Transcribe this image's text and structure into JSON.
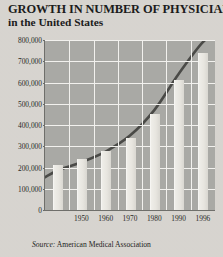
{
  "title": {
    "line1": "GROWTH IN NUMBER OF PHYSICIANS",
    "line2": "in the United States"
  },
  "source": {
    "label": "Source:",
    "text": " American Medical Association"
  },
  "colors": {
    "page_background": "#d8d5d0",
    "plot_background": "#a9a9a5",
    "gridline": "#f2f1ee",
    "bar_fill": "#e8e6e1",
    "curve": "#4a4a47",
    "text": "#1c1c1c"
  },
  "chart_data": {
    "type": "bar",
    "title": "GROWTH IN NUMBER OF PHYSICIANS in the United States",
    "subtitle": "in the United States",
    "xlabel": "",
    "ylabel": "",
    "ylim": [
      0,
      800000
    ],
    "ytick_values": [
      0,
      100000,
      200000,
      300000,
      400000,
      500000,
      600000,
      700000,
      800000
    ],
    "ytick_labels": [
      "0",
      "100,000",
      "200,000",
      "300,000",
      "400,000",
      "500,000",
      "600,000",
      "700,000",
      "800,000"
    ],
    "xtick_labels": [
      "1950",
      "1960",
      "1970",
      "1980",
      "1990",
      "1996"
    ],
    "grid": true,
    "legend": false,
    "categories": [
      "1940",
      "1950",
      "1960",
      "1970",
      "1980",
      "1990",
      "1996"
    ],
    "values": [
      210000,
      240000,
      280000,
      340000,
      450000,
      610000,
      740000
    ],
    "series": [
      {
        "name": "Number of physicians",
        "values": [
          210000,
          240000,
          280000,
          340000,
          450000,
          610000,
          740000
        ]
      },
      {
        "name": "Trend curve",
        "type": "line",
        "values": [
          185000,
          225000,
          275000,
          350000,
          470000,
          640000,
          790000
        ]
      }
    ],
    "annotations": [],
    "source": "Source: American Medical Association"
  }
}
